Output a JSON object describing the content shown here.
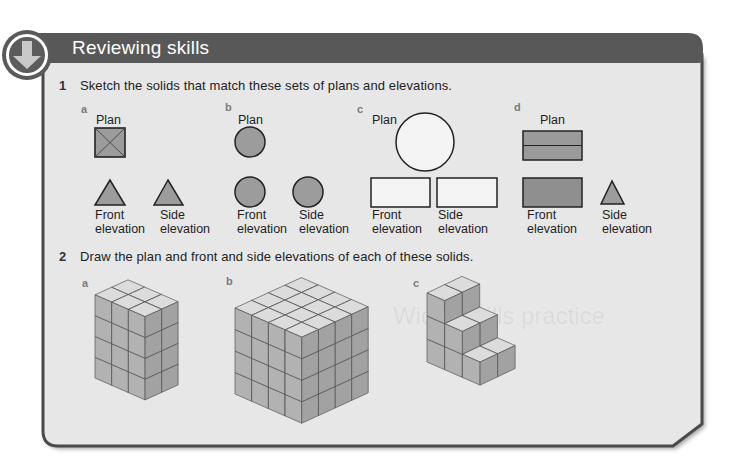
{
  "header": {
    "title": "Reviewing skills",
    "icon": "down-arrow-icon"
  },
  "watermark": "Wider skills practice",
  "colors": {
    "header_bg": "#585858",
    "panel_bg": "#e7e7e7",
    "panel_border": "#4a4a4a",
    "shape_fill": "#9c9c9c",
    "shape_fill_light": "#f4f4f4",
    "cube_top": "#dcdcdc",
    "cube_left": "#b2b2b2",
    "cube_right": "#a2a2a2"
  },
  "questions": [
    {
      "number": "1",
      "text": "Sketch the solids that match these sets of plans and elevations.",
      "parts": [
        {
          "letter": "a",
          "plan_label": "Plan",
          "plan_shape": "square-with-diagonals",
          "front_label": [
            "Front",
            "elevation"
          ],
          "front_shape": "triangle",
          "side_label": [
            "Side",
            "elevation"
          ],
          "side_shape": "triangle"
        },
        {
          "letter": "b",
          "plan_label": "Plan",
          "plan_shape": "circle",
          "front_label": [
            "Front",
            "elevation"
          ],
          "front_shape": "circle",
          "side_label": [
            "Side",
            "elevation"
          ],
          "side_shape": "circle"
        },
        {
          "letter": "c",
          "plan_label": "Plan",
          "plan_shape": "large-circle",
          "front_label": [
            "Front",
            "elevation"
          ],
          "front_shape": "rectangle",
          "side_label": [
            "Side",
            "elevation"
          ],
          "side_shape": "rectangle"
        },
        {
          "letter": "d",
          "plan_label": "Plan",
          "plan_shape": "rectangle-with-midline",
          "front_label": [
            "Front",
            "elevation"
          ],
          "front_shape": "rectangle",
          "side_label": [
            "Side",
            "elevation"
          ],
          "side_shape": "triangle"
        }
      ]
    },
    {
      "number": "2",
      "text": "Draw the plan and front and side elevations of each of these solids.",
      "parts": [
        {
          "letter": "a",
          "solid": {
            "length": 3,
            "width": 2,
            "heights": [
              4,
              4,
              4
            ]
          }
        },
        {
          "letter": "b",
          "solid": {
            "length": 4,
            "width": 4,
            "heights": [
              4,
              4,
              4,
              4
            ]
          }
        },
        {
          "letter": "c",
          "solid": {
            "length": 3,
            "width": 2,
            "heights": [
              3,
              2,
              1
            ]
          }
        }
      ]
    }
  ]
}
